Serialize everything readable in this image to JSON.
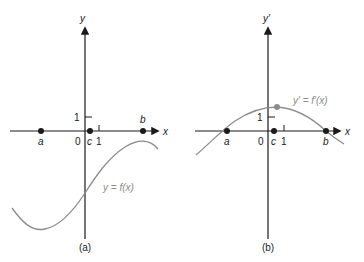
{
  "panels": [
    {
      "id": "a",
      "caption": "(a)",
      "y_axis_label": "y",
      "x_axis_label": "x",
      "y_tick_label": "1",
      "x_tick_label": "1",
      "origin_label": "0",
      "points": [
        {
          "label": "a"
        },
        {
          "label": "c"
        },
        {
          "label": "b"
        }
      ],
      "curve_label": "y = f(x)"
    },
    {
      "id": "b",
      "caption": "(b)",
      "y_axis_label": "y′",
      "x_axis_label": "x",
      "y_tick_label": "1",
      "x_tick_label": "1",
      "origin_label": "0",
      "points": [
        {
          "label": "a"
        },
        {
          "label": "c"
        },
        {
          "label": "b"
        }
      ],
      "curve_label": "y′ = f′(x)"
    }
  ],
  "colors": {
    "axis": "#1a1a1a",
    "curve": "#8c8c8c",
    "point": "#1a1a1a",
    "highlight_point": "#8c8c8c"
  }
}
